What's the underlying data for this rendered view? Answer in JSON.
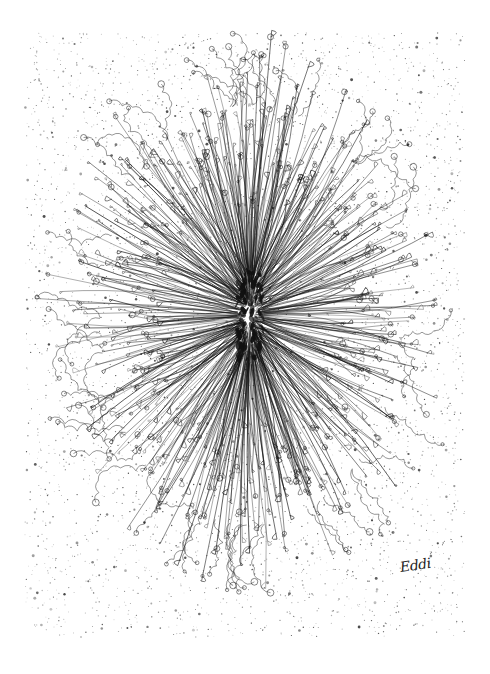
{
  "artwork": {
    "description": "Ink drawing of a radial burst of fine curling lines on a speckled white background",
    "signature": "Eddi",
    "colors": {
      "background": "#ffffff",
      "ink": "#111111",
      "speckle": "#333333"
    },
    "paper_area": {
      "x": 25,
      "y": 33,
      "width": 440,
      "height": 604
    },
    "burst_center": {
      "x": 250,
      "y": 315
    }
  }
}
